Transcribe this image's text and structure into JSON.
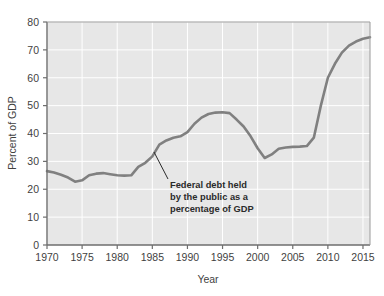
{
  "chart_data": {
    "type": "line",
    "title": "",
    "subtitle": "",
    "xlabel": "Year",
    "ylabel": "Percent of GDP",
    "xlim": [
      1970,
      2016
    ],
    "ylim": [
      0,
      80
    ],
    "xticks": [
      1970,
      1975,
      1980,
      1985,
      1990,
      1995,
      2000,
      2005,
      2010,
      2015
    ],
    "yticks": [
      0,
      10,
      20,
      30,
      40,
      50,
      60,
      70,
      80
    ],
    "xtick_labels": [
      "1970",
      "1975",
      "1980",
      "1985",
      "1990",
      "1995",
      "2000",
      "2005",
      "2010",
      "2015"
    ],
    "ytick_labels": [
      "0",
      "10",
      "20",
      "30",
      "40",
      "50",
      "60",
      "70",
      "80"
    ],
    "grid": true,
    "grid_color": "#ffffff",
    "plot_bgcolor": "#e7e7e7",
    "legend": null,
    "series": [
      {
        "name": "Federal debt held by the public as a percentage of GDP",
        "color": "#808080",
        "x": [
          1970,
          1971,
          1972,
          1973,
          1974,
          1975,
          1976,
          1977,
          1978,
          1979,
          1980,
          1981,
          1982,
          1983,
          1984,
          1985,
          1986,
          1987,
          1988,
          1989,
          1990,
          1991,
          1992,
          1993,
          1994,
          1995,
          1996,
          1997,
          1998,
          1999,
          2000,
          2001,
          2002,
          2003,
          2004,
          2005,
          2006,
          2007,
          2008,
          2009,
          2010,
          2011,
          2012,
          2013,
          2014,
          2015,
          2016
        ],
        "y": [
          26.5,
          26.0,
          25.2,
          24.2,
          22.7,
          23.2,
          25.0,
          25.6,
          25.8,
          25.4,
          25.0,
          24.9,
          25.0,
          28.0,
          29.5,
          31.8,
          36.0,
          37.5,
          38.5,
          39.0,
          40.5,
          43.5,
          45.7,
          47.0,
          47.5,
          47.6,
          47.3,
          45.0,
          42.5,
          39.0,
          34.7,
          31.2,
          32.5,
          34.5,
          35.0,
          35.2,
          35.3,
          35.5,
          38.5,
          50.0,
          60.0,
          65.0,
          69.0,
          71.5,
          73.0,
          74.0,
          74.5
        ]
      }
    ],
    "annotations": [
      {
        "name": "series-callout",
        "lines": [
          "Federal debt held",
          "by the public as a",
          "percentage of GDP"
        ],
        "text_x": 170,
        "text_y": 185,
        "leader_from_x": 154,
        "leader_from_y": 152,
        "leader_to_x": 168,
        "leader_to_y": 179
      }
    ]
  }
}
